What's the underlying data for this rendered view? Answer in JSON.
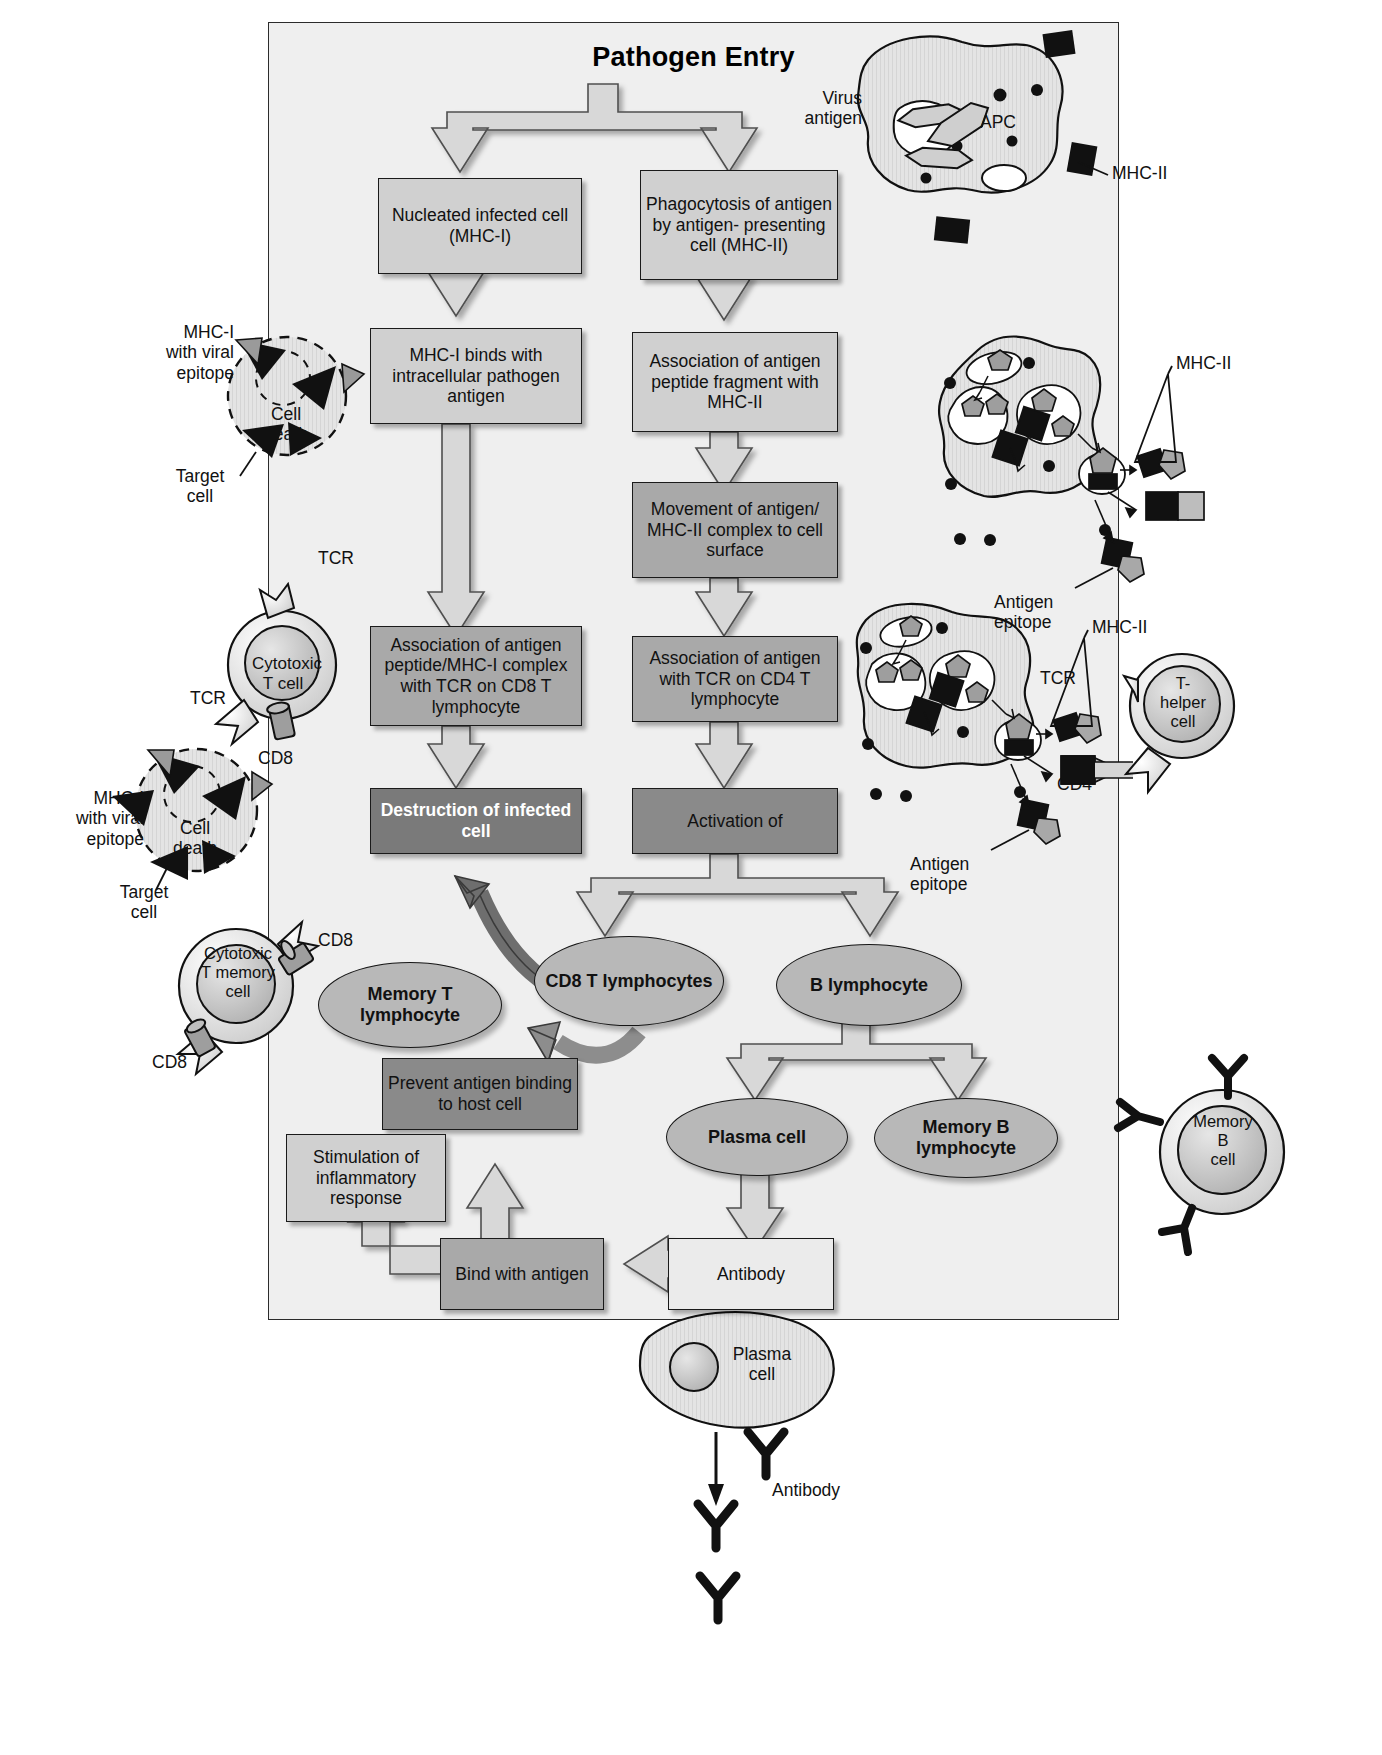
{
  "figure": {
    "title": "Pathogen Entry",
    "domain_note": "Adaptive immune response flow diagram"
  },
  "palette": {
    "panel_bg": "#efefef",
    "box_light": "#d0d0d0",
    "box_medium": "#a9a9a9",
    "box_dark": "#8a8a8a",
    "box_verydark": "#7a7a7a",
    "ellipse": "#b8b8b8",
    "outline": "#1a1a1a",
    "white_text": "#ffffff"
  },
  "boxes": {
    "nucleated_cell": "Nucleated infected\ncell (MHC-I)",
    "phagocytosis": "Phagocytosis of\nantigen by antigen-\npresenting cell\n(MHC-II)",
    "mhc1_binds": "MHC-I binds\nwith intracellular\npathogen antigen",
    "assoc_peptide_mhc2": "Association of\nantigen peptide\nfragment with MHC-II",
    "movement_complex": "Movement of antigen/\nMHC-II complex to\ncell surface",
    "assoc_tcr_cd8": "Association of antigen\npeptide/MHC-I\ncomplex with TCR on\nCD8 T lymphocyte",
    "assoc_tcr_cd4": "Association of antigen\nwith TCR on CD4\nT lymphocyte",
    "destruction": "Destruction of\ninfected cell",
    "activation": "Activation of",
    "prevent_binding": "Prevent antigen\nbinding to host cell",
    "stimulation": "Stimulation of\ninflammatory\nresponse",
    "bind_antigen": "Bind with\nantigen",
    "antibody": "Antibody"
  },
  "ellipses": {
    "memory_t": "Memory T\nlymphocyte",
    "cd8_t_lymphocytes": "CD8\nT lymphocytes",
    "b_lymphocyte": "B lymphocyte",
    "plasma_cell": "Plasma cell",
    "memory_b_lymphocyte": "Memory\nB lymphocyte"
  },
  "cell_art": {
    "apc": {
      "name": "APC",
      "virus_antigen": "Virus\nantigen",
      "mhc2": "MHC-II"
    },
    "target_cell_top": {
      "mhc1_epitope": "MHC-I\nwith viral\nepitope",
      "cell_death": "Cell\ndeath",
      "target_cell": "Target\ncell"
    },
    "target_cell_bottom": {
      "mhc1_epitope": "MHC-I\nwith viral\nepitope",
      "cell_death": "Cell\ndeath",
      "target_cell": "Target\ncell"
    },
    "cytotoxic_t_cell": {
      "name": "Cytotoxic\nT cell",
      "tcr_top": "TCR",
      "tcr_left": "TCR",
      "cd8": "CD8"
    },
    "cytotoxic_t_memory_cell": {
      "name": "Cytotoxic\nT memory\ncell",
      "cd8_top": "CD8",
      "cd8_bottom": "CD8"
    },
    "apc_middle": {
      "mhc2": "MHC-II",
      "antigen_epitope": "Antigen\nepitope"
    },
    "apc_lower": {
      "mhc2": "MHC-II",
      "antigen_epitope": "Antigen\nepitope",
      "tcr": "TCR",
      "cd4": "CD4"
    },
    "t_helper_cell": {
      "name": "T-\nhelper\ncell"
    },
    "memory_b_cell": {
      "name": "Memory\nB\ncell"
    },
    "plasma_cell_bottom": {
      "name": "Plasma\ncell",
      "antibody": "Antibody"
    }
  }
}
